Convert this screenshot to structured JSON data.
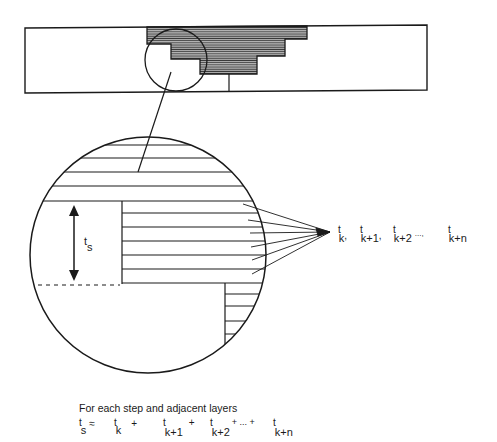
{
  "diagram": {
    "overview": {
      "description": "Layered part cross-section with staircase overhang",
      "detail_marker": "small-circle"
    },
    "detail_view": {
      "dimension_label": "t",
      "dimension_subscript": "s",
      "layer_labels": [
        {
          "t": "t",
          "sub": "k",
          "sep": ","
        },
        {
          "t": "t",
          "sub": "k+1",
          "sep": ","
        },
        {
          "t": "t",
          "sub": "k+2",
          "sep": "...,"
        },
        {
          "t": "t",
          "sub": "k+n",
          "sep": ""
        }
      ]
    },
    "caption": {
      "line1": "For each step and adjacent layers",
      "formula": {
        "lhs_t": "t",
        "lhs_sub": "s",
        "relation": "≈",
        "terms": [
          {
            "t": "t",
            "sub": "k",
            "op": "+"
          },
          {
            "t": "t",
            "sub": "k+1",
            "op": "+"
          },
          {
            "t": "t",
            "sub": "k+2",
            "op": "+ ... +"
          },
          {
            "t": "t",
            "sub": "k+n",
            "op": ""
          }
        ]
      }
    },
    "colors": {
      "ink": "#1a1a1a",
      "hatch_fill": "#8a8a8a",
      "background": "#ffffff"
    }
  }
}
